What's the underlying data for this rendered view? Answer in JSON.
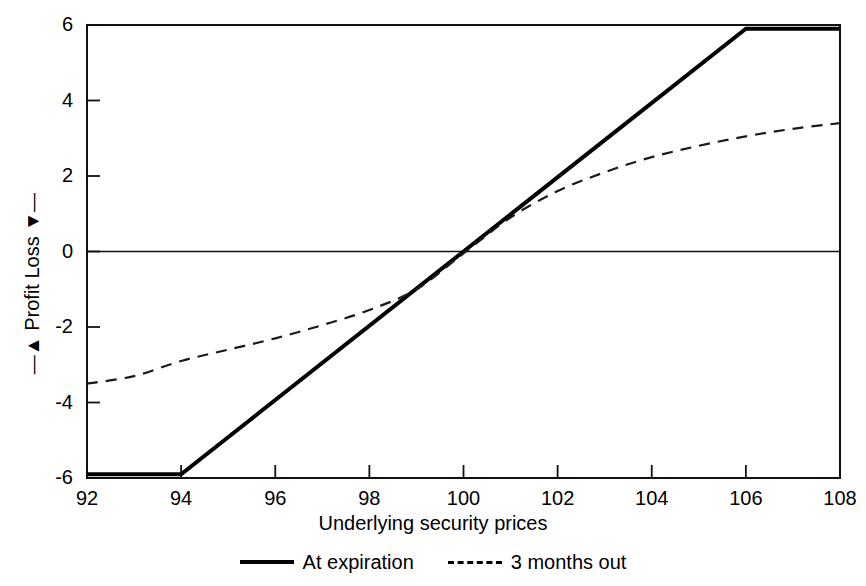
{
  "chart_data": {
    "type": "line",
    "title": "",
    "subtitle": "",
    "xlabel": "Underlying security prices",
    "ylabel": "Profit / Loss",
    "ylabel_upper": "Profit",
    "ylabel_lower": "Loss",
    "ylabel_up_arrow": "↑",
    "ylabel_down_arrow": "↓",
    "xlim": [
      92,
      108
    ],
    "ylim": [
      -6,
      6
    ],
    "xticks": [
      92,
      94,
      96,
      98,
      100,
      102,
      104,
      106,
      108
    ],
    "yticks": [
      6,
      4,
      2,
      0,
      -2,
      -4,
      -6
    ],
    "xtick_labels": [
      "92",
      "94",
      "96",
      "98",
      "100",
      "102",
      "104",
      "106",
      "108"
    ],
    "ytick_labels": [
      "6",
      "4",
      "2",
      "0",
      "-2",
      "-4",
      "-6"
    ],
    "grid": false,
    "zero_line": 0,
    "legend_position": "below-axes",
    "series": [
      {
        "name": "At expiration",
        "style": "solid",
        "color": "#000000",
        "x": [
          92,
          94,
          100,
          106,
          108
        ],
        "values": [
          -5.9,
          -5.9,
          0.0,
          5.9,
          5.9
        ]
      },
      {
        "name": "3 months out",
        "style": "dashed",
        "color": "#1a1a1a",
        "x": [
          92,
          93,
          94,
          95,
          96,
          97,
          98,
          99,
          100,
          101,
          102,
          103,
          104,
          105,
          106,
          107,
          108
        ],
        "values": [
          -3.5,
          -3.3,
          -2.9,
          -2.6,
          -2.3,
          -1.95,
          -1.55,
          -1.0,
          -0.05,
          0.9,
          1.6,
          2.1,
          2.5,
          2.8,
          3.05,
          3.25,
          3.4
        ]
      }
    ]
  },
  "legend": {
    "items": [
      {
        "label": "At expiration",
        "style": "solid"
      },
      {
        "label": "3 months out",
        "style": "dashed"
      }
    ]
  }
}
